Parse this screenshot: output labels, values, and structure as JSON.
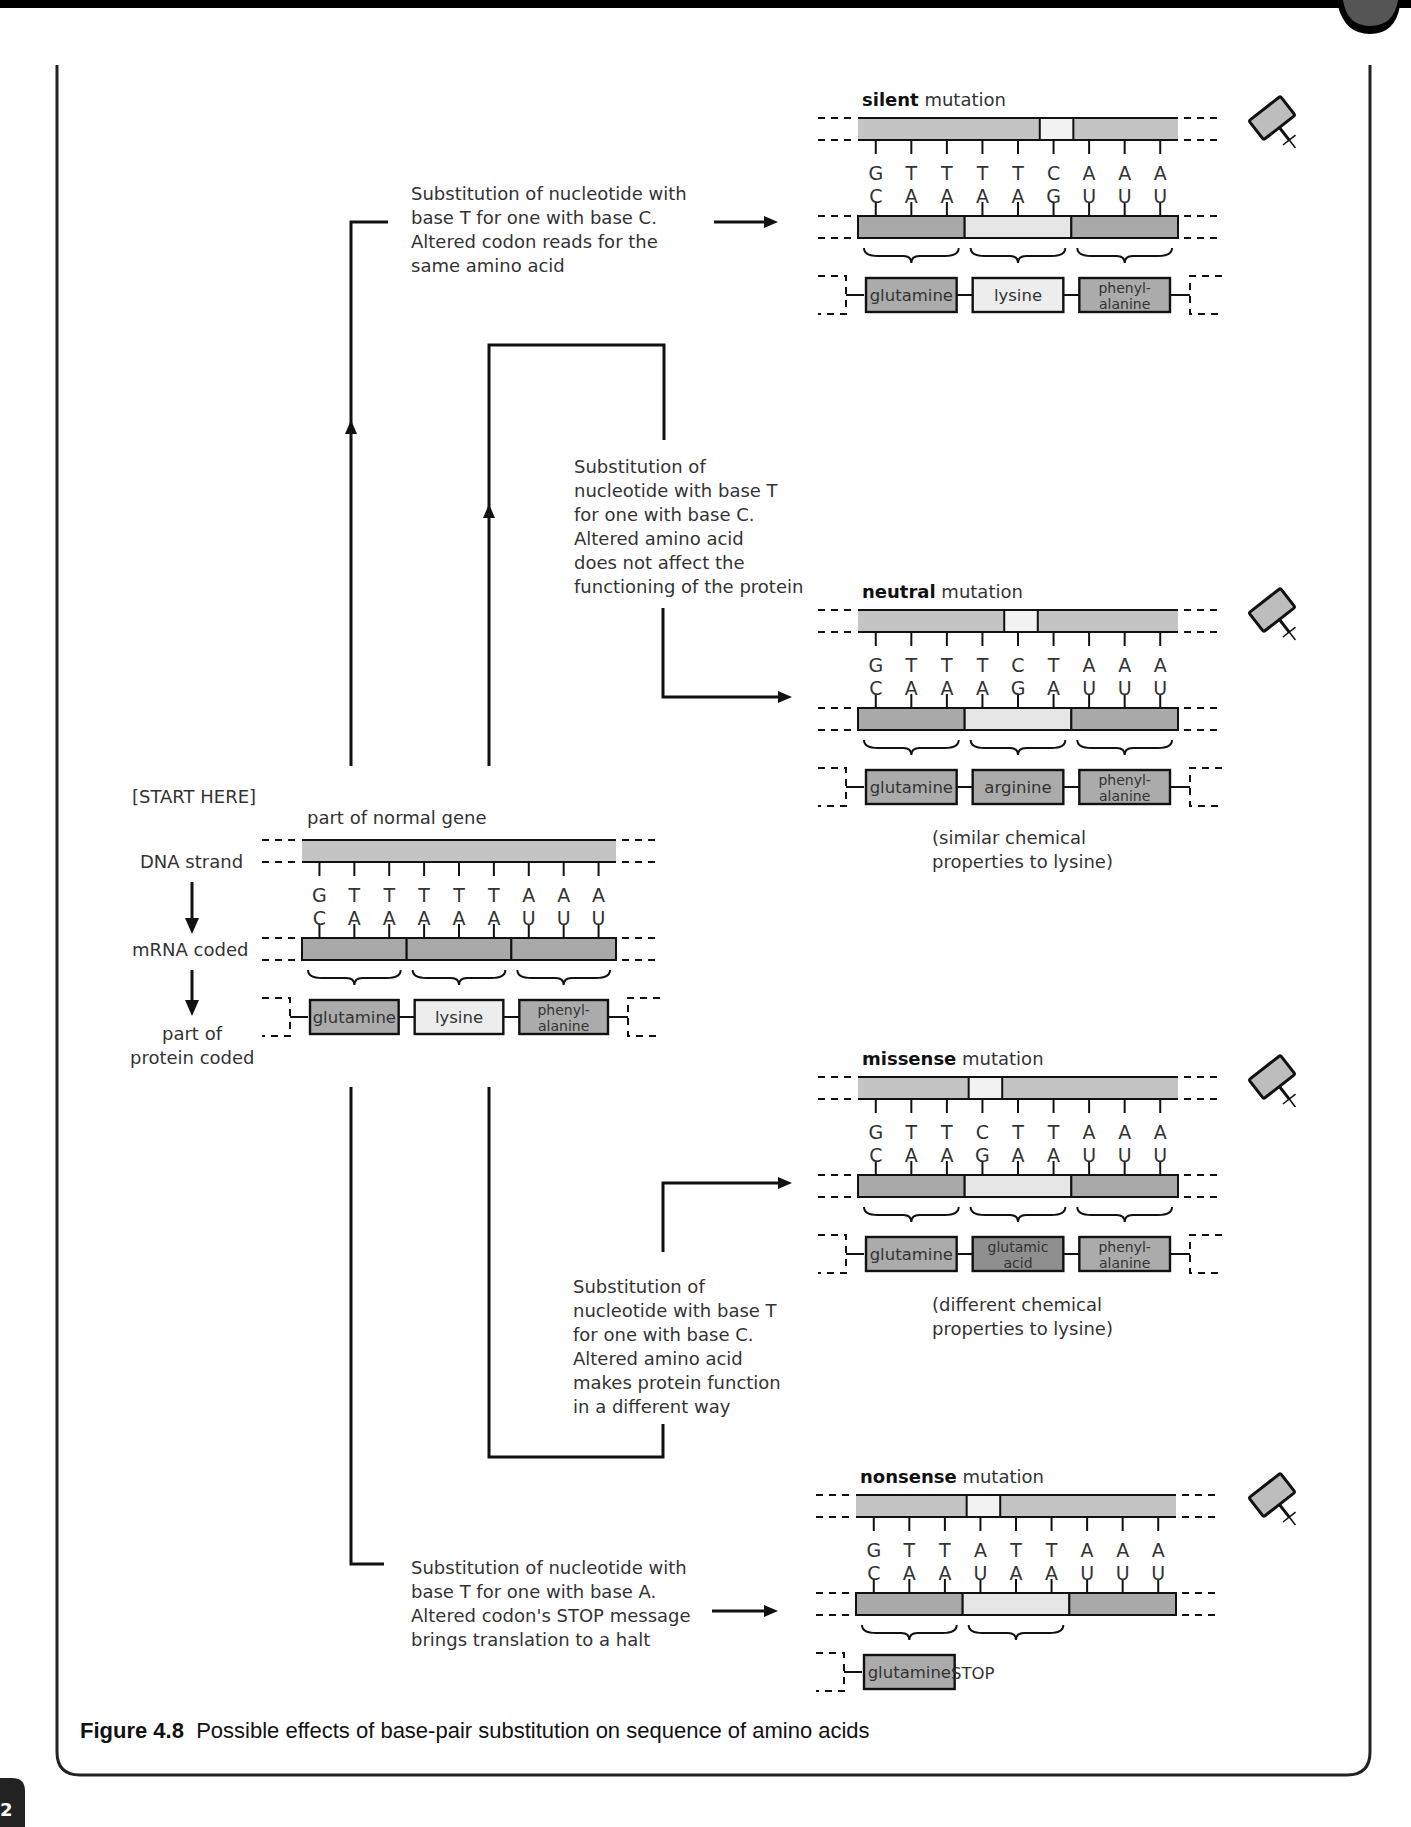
{
  "colors": {
    "dna_strand": "#c4c4c4",
    "mrna_strand": "#a9a9a9",
    "mrna_highlight": "#e6e6e6",
    "mutation_gap": "#f2f2f2",
    "amino_dark": "#ababab",
    "amino_light": "#ededed",
    "amino_altered": "#8f8f8f",
    "frame": "#111111",
    "top_bar": "#000000",
    "tab": "#555555"
  },
  "page": {
    "page_number": "2"
  },
  "normal": {
    "start_label": "[START HERE]",
    "title": "part of normal gene",
    "row_labels": {
      "dna": "DNA strand",
      "mrna": "mRNA coded",
      "protein_line1": "part of",
      "protein_line2": "protein coded"
    },
    "dna_bases": [
      "G",
      "T",
      "T",
      "T",
      "T",
      "T",
      "A",
      "A",
      "A"
    ],
    "mrna_bases": [
      "C",
      "A",
      "A",
      "A",
      "A",
      "A",
      "U",
      "U",
      "U"
    ],
    "amino_acids": [
      {
        "line1": "glutamine",
        "line2": "",
        "tone": "dark"
      },
      {
        "line1": "lysine",
        "line2": "",
        "tone": "light"
      },
      {
        "line1": "phenyl-",
        "line2": "alanine",
        "tone": "dark"
      }
    ]
  },
  "mutations": [
    {
      "id": "silent",
      "title_bold": "silent",
      "title_rest": " mutation",
      "dna_bases": [
        "G",
        "T",
        "T",
        "T",
        "T",
        "C",
        "A",
        "A",
        "A"
      ],
      "mrna_bases": [
        "C",
        "A",
        "A",
        "A",
        "A",
        "G",
        "U",
        "U",
        "U"
      ],
      "mutated_index": 5,
      "amino_acids": [
        {
          "line1": "glutamine",
          "line2": "",
          "tone": "dark"
        },
        {
          "line1": "lysine",
          "line2": "",
          "tone": "light"
        },
        {
          "line1": "phenyl-",
          "line2": "alanine",
          "tone": "dark"
        }
      ],
      "note_line1": "",
      "note_line2": "",
      "description": [
        "Substitution of nucleotide with",
        "base T for one with base C.",
        "Altered codon reads for the",
        "same amino acid"
      ]
    },
    {
      "id": "neutral",
      "title_bold": "neutral",
      "title_rest": " mutation",
      "dna_bases": [
        "G",
        "T",
        "T",
        "T",
        "C",
        "T",
        "A",
        "A",
        "A"
      ],
      "mrna_bases": [
        "C",
        "A",
        "A",
        "A",
        "G",
        "A",
        "U",
        "U",
        "U"
      ],
      "mutated_index": 4,
      "amino_acids": [
        {
          "line1": "glutamine",
          "line2": "",
          "tone": "dark"
        },
        {
          "line1": "arginine",
          "line2": "",
          "tone": "dark"
        },
        {
          "line1": "phenyl-",
          "line2": "alanine",
          "tone": "dark"
        }
      ],
      "note_line1": "(similar chemical",
      "note_line2": "properties to lysine)",
      "description": [
        "Substitution of",
        "nucleotide with base T",
        "for one with base C.",
        "Altered amino acid",
        "does not affect the",
        "functioning of the protein"
      ]
    },
    {
      "id": "missense",
      "title_bold": "missense",
      "title_rest": " mutation",
      "dna_bases": [
        "G",
        "T",
        "T",
        "C",
        "T",
        "T",
        "A",
        "A",
        "A"
      ],
      "mrna_bases": [
        "C",
        "A",
        "A",
        "G",
        "A",
        "A",
        "U",
        "U",
        "U"
      ],
      "mutated_index": 3,
      "amino_acids": [
        {
          "line1": "glutamine",
          "line2": "",
          "tone": "dark"
        },
        {
          "line1": "glutamic",
          "line2": "acid",
          "tone": "altered"
        },
        {
          "line1": "phenyl-",
          "line2": "alanine",
          "tone": "dark"
        }
      ],
      "note_line1": "(different chemical",
      "note_line2": "properties to lysine)",
      "description": [
        "Substitution of",
        "nucleotide with base T",
        "for one with base C.",
        "Altered amino acid",
        "makes protein function",
        "in a different way"
      ]
    },
    {
      "id": "nonsense",
      "title_bold": "nonsense",
      "title_rest": " mutation",
      "dna_bases": [
        "G",
        "T",
        "T",
        "A",
        "T",
        "T",
        "A",
        "A",
        "A"
      ],
      "mrna_bases": [
        "C",
        "A",
        "A",
        "U",
        "A",
        "A",
        "U",
        "U",
        "U"
      ],
      "mutated_index": 3,
      "amino_acids": [
        {
          "line1": "glutamine",
          "line2": "",
          "tone": "dark"
        }
      ],
      "stop_label": "STOP",
      "note_line1": "",
      "note_line2": "",
      "description": [
        "Substitution of nucleotide with",
        "base T for one with base A.",
        "Altered codon's STOP message",
        "brings translation to a halt"
      ]
    }
  ],
  "icons": {
    "mutagen": "mutagen-stamp-icon"
  },
  "caption": {
    "label": "Figure 4.8",
    "text": "  Possible effects of base-pair substitution on sequence of amino acids"
  }
}
